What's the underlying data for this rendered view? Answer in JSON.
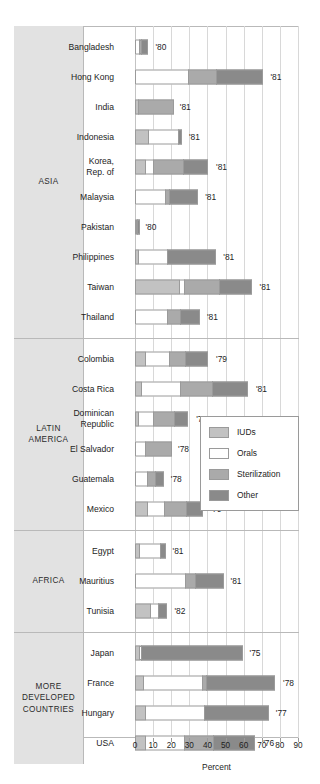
{
  "chart_data": {
    "type": "bar",
    "orientation": "horizontal",
    "stacked": true,
    "title": "",
    "xlabel": "Percent",
    "ylabel": "",
    "xlim": [
      0,
      90
    ],
    "xticks": [
      0,
      10,
      20,
      30,
      40,
      50,
      60,
      70,
      80,
      90
    ],
    "xtick_labels": [
      "0",
      "10",
      "20",
      "30",
      "40",
      "50",
      "60",
      "70",
      "80",
      "90"
    ],
    "grid": true,
    "legend_position": "center-right",
    "series": [
      {
        "name": "IUDs",
        "key": "iuds",
        "color": "#c2c2c2"
      },
      {
        "name": "Orals",
        "key": "orals",
        "color": "#ffffff"
      },
      {
        "name": "Sterilization",
        "key": "sterilization",
        "color": "#aaaaaa"
      },
      {
        "name": "Other",
        "key": "other",
        "color": "#8a8a8a"
      }
    ],
    "groups": [
      {
        "label": "ASIA",
        "rows": [
          {
            "label": "Bangladesh",
            "year": "'80",
            "iuds": 0.0,
            "orals": 3.0,
            "sterilization": 1.5,
            "other": 4.0
          },
          {
            "label": "Hong Kong",
            "year": "'81",
            "iuds": 0.0,
            "orals": 30.0,
            "sterilization": 16.0,
            "other": 26.0
          },
          {
            "label": "India",
            "year": "'81",
            "iuds": 2.0,
            "orals": 0.0,
            "sterilization": 20.0,
            "other": 0.0
          },
          {
            "label": "Indonesia",
            "year": "'81",
            "iuds": 8.0,
            "orals": 17.0,
            "sterilization": 0.0,
            "other": 2.0
          },
          {
            "label": "Korea,\nRep. of",
            "year": "'81",
            "iuds": 6.0,
            "orals": 5.0,
            "sterilization": 17.0,
            "other": 14.0
          },
          {
            "label": "Malaysia",
            "year": "'81",
            "iuds": 0.0,
            "orals": 17.0,
            "sterilization": 3.0,
            "other": 16.0
          },
          {
            "label": "Pakistan",
            "year": "'80",
            "iuds": 1.0,
            "orals": 0.5,
            "sterilization": 0.0,
            "other": 1.5
          },
          {
            "label": "Philippines",
            "year": "'81",
            "iuds": 2.0,
            "orals": 17.0,
            "sterilization": 0.0,
            "other": 27.0
          },
          {
            "label": "Taiwan",
            "year": "'81",
            "iuds": 25.0,
            "orals": 3.0,
            "sterilization": 20.0,
            "other": 18.0
          },
          {
            "label": "Thailand",
            "year": "'81",
            "iuds": 0.0,
            "orals": 18.0,
            "sterilization": 8.0,
            "other": 11.0
          }
        ]
      },
      {
        "label": "LATIN\nAMERICA",
        "rows": [
          {
            "label": "Colombia",
            "year": "'79",
            "iuds": 6.0,
            "orals": 14.0,
            "sterilization": 9.0,
            "other": 13.0
          },
          {
            "label": "Costa Rica",
            "year": "'81",
            "iuds": 4.0,
            "orals": 22.0,
            "sterilization": 18.0,
            "other": 20.0
          },
          {
            "label": "Dominican\nRepublic",
            "year": "'77",
            "iuds": 2.0,
            "orals": 9.0,
            "sterilization": 12.0,
            "other": 8.0
          },
          {
            "label": "El Salvador",
            "year": "'78",
            "iuds": 0.0,
            "orals": 6.0,
            "sterilization": 15.0,
            "other": 0.0
          },
          {
            "label": "Guatemala",
            "year": "'78",
            "iuds": 0.0,
            "orals": 7.0,
            "sterilization": 5.0,
            "other": 5.0
          },
          {
            "label": "Mexico",
            "year": "'79",
            "iuds": 7.0,
            "orals": 10.0,
            "sterilization": 13.0,
            "other": 9.0
          }
        ]
      },
      {
        "label": "AFRICA",
        "rows": [
          {
            "label": "Egypt",
            "year": "'81",
            "iuds": 3.0,
            "orals": 12.0,
            "sterilization": 0.0,
            "other": 3.0
          },
          {
            "label": "Mauritius",
            "year": "'81",
            "iuds": 0.0,
            "orals": 28.0,
            "sterilization": 6.0,
            "other": 16.0
          },
          {
            "label": "Tunisia",
            "year": "'82",
            "iuds": 9.0,
            "orals": 5.0,
            "sterilization": 0.0,
            "other": 5.0
          }
        ]
      },
      {
        "label": "MORE\nDEVELOPED\nCOUNTRIES",
        "rows": [
          {
            "label": "Japan",
            "year": "'75",
            "iuds": 3.0,
            "orals": 1.5,
            "sterilization": 0.0,
            "other": 56.0
          },
          {
            "label": "France",
            "year": "'78",
            "iuds": 5.0,
            "orals": 33.0,
            "sterilization": 3.0,
            "other": 38.0
          },
          {
            "label": "Hungary",
            "year": "'77",
            "iuds": 6.0,
            "orals": 33.0,
            "sterilization": 0.0,
            "other": 36.0
          },
          {
            "label": "USA",
            "year": "'76",
            "iuds": 6.0,
            "orals": 22.0,
            "sterilization": 17.0,
            "other": 23.0
          }
        ]
      }
    ]
  },
  "legend": {
    "items": [
      "IUDs",
      "Orals",
      "Sterilization",
      "Other"
    ]
  },
  "axis": {
    "title": "Percent",
    "labels": [
      "0",
      "10",
      "20",
      "30",
      "40",
      "50",
      "60",
      "70",
      "80",
      "90"
    ]
  }
}
